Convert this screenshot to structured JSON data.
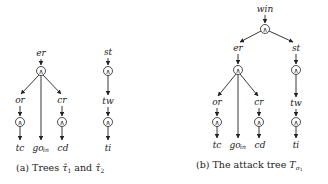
{
  "panel_a": {
    "caption_prefix": "(a) Trees ",
    "caption_mid": " and ",
    "tau": "τ̂",
    "sub1": "1",
    "sub2": "2",
    "tree1": {
      "root": "er",
      "gate": "∧",
      "children": [
        {
          "label": "or",
          "gate": "∧",
          "leaf": "tc"
        },
        {
          "label": "go",
          "label_sub": "in"
        },
        {
          "label": "cr",
          "gate": "∧",
          "leaf": "cd"
        }
      ]
    },
    "tree2": {
      "root": "st",
      "gate1": "∧",
      "mid": "tw",
      "gate2": "∧",
      "leaf": "ti"
    }
  },
  "panel_b": {
    "caption_prefix": "(b) The attack tree ",
    "T": "T",
    "sigma": "σ",
    "sigma_sub": "1",
    "root": "win",
    "root_gate": "∧",
    "left": {
      "label": "er",
      "gate": "∧",
      "children": [
        {
          "label": "or",
          "gate": "∧",
          "leaf": "tc"
        },
        {
          "label": "go",
          "label_sub": "in"
        },
        {
          "label": "cr",
          "gate": "∧",
          "leaf": "cd"
        }
      ]
    },
    "right": {
      "label": "st",
      "gate1": "∧",
      "mid": "tw",
      "gate2": "∧",
      "leaf": "ti"
    }
  }
}
